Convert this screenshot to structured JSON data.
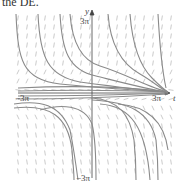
{
  "caption": "the DE.",
  "diagram": {
    "type": "direction-field",
    "x_axis_label": "t",
    "y_axis_label": "y",
    "x_tick_left": "−3π",
    "x_tick_right": "3π",
    "y_tick_top": "3π",
    "y_tick_bottom": "−3π",
    "colors": {
      "curve": "#8a8a8a",
      "field": "#9a9a9a",
      "axis": "#444444"
    }
  }
}
